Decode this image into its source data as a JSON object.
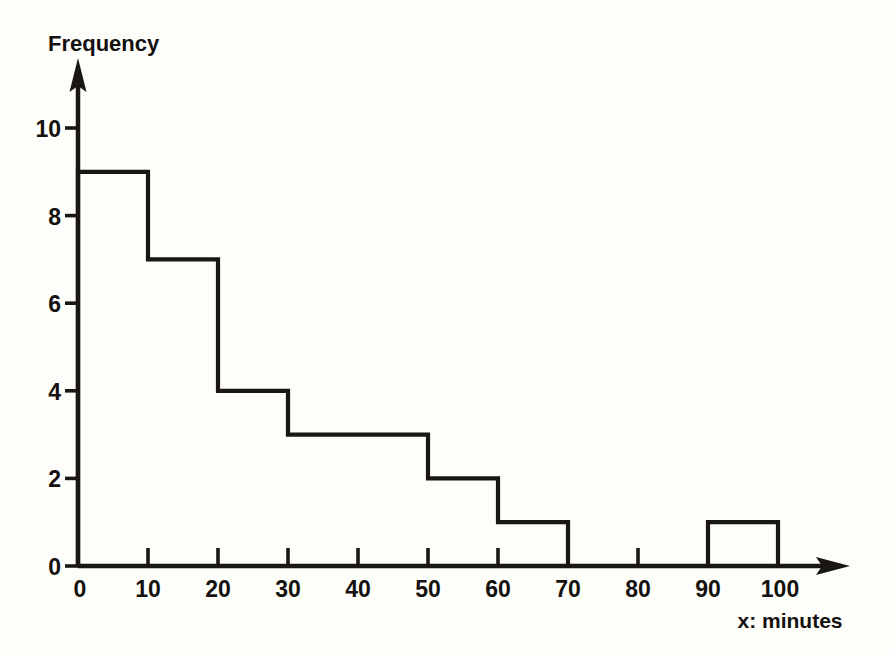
{
  "chart_data": {
    "type": "bar",
    "title": "",
    "subtitle": "",
    "ylabel": "Frequency",
    "xlabel": "x: minutes",
    "categories": [
      "0-10",
      "10-20",
      "20-30",
      "30-40",
      "40-50",
      "50-60",
      "60-70",
      "70-80",
      "80-90",
      "90-100"
    ],
    "bin_edges": [
      0,
      10,
      20,
      30,
      40,
      50,
      60,
      70,
      80,
      90,
      100
    ],
    "values": [
      9,
      7,
      4,
      3,
      3,
      2,
      1,
      0,
      0,
      1
    ],
    "bin_width": 10,
    "xlim": [
      0,
      100
    ],
    "ylim": [
      0,
      11
    ],
    "xticks": [
      0,
      10,
      20,
      30,
      40,
      50,
      60,
      70,
      80,
      90,
      100
    ],
    "yticks": [
      0,
      2,
      4,
      6,
      8,
      10
    ],
    "xtick_labels": [
      "0",
      "10",
      "20",
      "30",
      "40",
      "50",
      "60",
      "70",
      "80",
      "90",
      "100"
    ],
    "ytick_labels": [
      "0",
      "2",
      "4",
      "6",
      "8",
      "10"
    ],
    "grid": false,
    "legend": false,
    "legend_position": "none",
    "total_frequency": 30,
    "annotations": []
  },
  "axes": {
    "y_axis_title": "Frequency",
    "x_axis_title": "x: minutes",
    "y_origin_label": "0",
    "x_origin_label": "0"
  },
  "style": {
    "background": "#fdfdfa",
    "ink": "#1a1613",
    "text": "#14110f"
  }
}
